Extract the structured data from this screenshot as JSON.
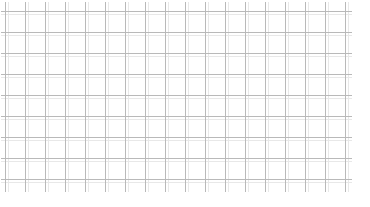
{
  "canvas": {
    "width": 370,
    "height": 207,
    "background_color": "#ffffff",
    "description": "blank-grid-pattern"
  },
  "grid": {
    "name": "graph-paper-grid",
    "line_color": "#b9b9b9",
    "faint_line_color": "#e8e8e8",
    "line_width": 1,
    "faint_line_width": 1,
    "vertical": {
      "count": 18,
      "start_x": 5,
      "spacing": 20,
      "top_y": 2,
      "bottom_y": 192,
      "positions": [
        5,
        25,
        45,
        65,
        85,
        105,
        125,
        145,
        165,
        185,
        205,
        225,
        245,
        265,
        285,
        305,
        325,
        345
      ]
    },
    "horizontal": {
      "count": 9,
      "start_y": 11,
      "spacing": 21,
      "left_x": 1,
      "right_x": 352,
      "positions": [
        11,
        32,
        53,
        74,
        95,
        116,
        137,
        158,
        179
      ]
    },
    "faint_vertical": {
      "positions": [
        8,
        28,
        48,
        68,
        88,
        108,
        128,
        148,
        168,
        188,
        208,
        228,
        248,
        268,
        288,
        308,
        328,
        348
      ]
    },
    "faint_horizontal": {
      "positions": [
        14,
        35,
        56,
        77,
        98,
        119,
        140,
        161,
        182
      ]
    }
  }
}
